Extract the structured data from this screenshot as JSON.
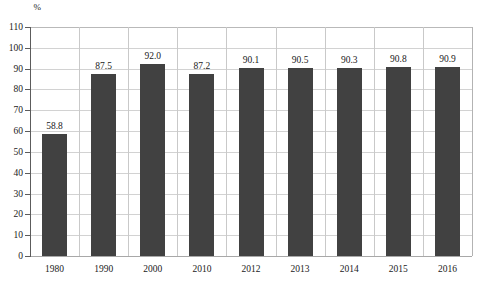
{
  "chart_data": {
    "type": "bar",
    "title": "",
    "subtitle": "",
    "xlabel": "",
    "ylabel": "%",
    "unit_label": "%",
    "categories": [
      "1980",
      "1990",
      "2000",
      "2010",
      "2012",
      "2013",
      "2014",
      "2015",
      "2016"
    ],
    "values": [
      58.8,
      87.5,
      92.0,
      87.2,
      90.1,
      90.5,
      90.3,
      90.8,
      90.9
    ],
    "value_labels": [
      "58.8",
      "87.5",
      "92.0",
      "87.2",
      "90.1",
      "90.5",
      "90.3",
      "90.8",
      "90.9"
    ],
    "ylim": [
      0,
      110
    ],
    "ytick_step": 10,
    "ytick_labels": [
      "110",
      "100",
      "90",
      "80",
      "70",
      "60",
      "50",
      "40",
      "30",
      "20",
      "10",
      "0"
    ],
    "ytick_values": [
      110,
      100,
      90,
      80,
      70,
      60,
      50,
      40,
      30,
      20,
      10,
      0
    ],
    "grid": true,
    "grid_orientation": "both",
    "legend": false,
    "legend_position": "none",
    "series": [
      {
        "name": "",
        "values": [
          58.8,
          87.5,
          92.0,
          87.2,
          90.1,
          90.5,
          90.3,
          90.8,
          90.9
        ],
        "color": "#414141"
      }
    ],
    "colors": {
      "bar": "#414141",
      "grid": "#d2d2d2",
      "axis": "#5c5c5c",
      "text": "#1a1a1a",
      "background": "#ffffff"
    },
    "annotations": []
  }
}
